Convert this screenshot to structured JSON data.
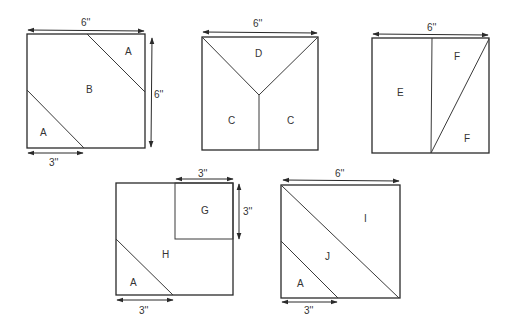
{
  "diagram": {
    "type": "quilt-block-patterns",
    "blocks": [
      {
        "id": "block-1",
        "pieces": [
          "A",
          "B",
          "A"
        ],
        "dimensions": {
          "top": "6''",
          "right": "6''",
          "bottom_left": "3''"
        }
      },
      {
        "id": "block-2",
        "pieces": [
          "D",
          "C",
          "C"
        ],
        "dimensions": {
          "top": "6''"
        }
      },
      {
        "id": "block-3",
        "pieces": [
          "E",
          "F",
          "F"
        ],
        "dimensions": {
          "top": "6''"
        }
      },
      {
        "id": "block-4",
        "pieces": [
          "G",
          "H",
          "A"
        ],
        "dimensions": {
          "top_right": "3''",
          "right_top": "3''",
          "bottom_left": "3''"
        }
      },
      {
        "id": "block-5",
        "pieces": [
          "I",
          "J",
          "A"
        ],
        "dimensions": {
          "top": "6''",
          "bottom_left": "3''"
        }
      }
    ]
  }
}
